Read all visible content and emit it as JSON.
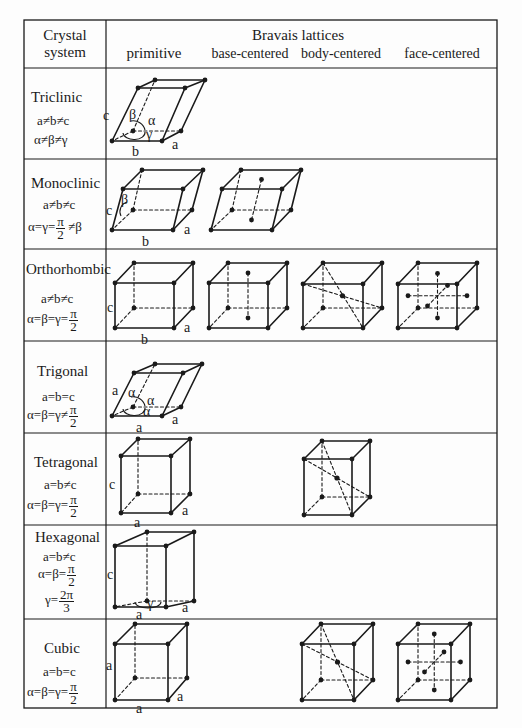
{
  "header": {
    "col1_line1": "Crystal",
    "col1_line2": "system",
    "col2_title": "Bravais lattices",
    "lattice_types": [
      "primitive",
      "base-centered",
      "body-centered",
      "face-centered"
    ]
  },
  "table": {
    "left": 24,
    "right": 497,
    "top": 20,
    "bottom": 708,
    "col_split": 106,
    "header_bottom": 68,
    "row_lines": [
      159,
      249,
      341,
      433,
      525,
      619
    ]
  },
  "systems": [
    {
      "name": "Triclinic",
      "cond1": "a≠b≠c",
      "cond2": "α≠β≠γ"
    },
    {
      "name": "Monoclinic",
      "cond1": "a≠b≠c",
      "cond2_pre": "α=γ=",
      "frac_num": "π",
      "frac_den": "2",
      "cond2_post": " ≠β"
    },
    {
      "name": "Orthorhombic",
      "cond1": "a≠b≠c",
      "cond2_pre": "α=β=γ=",
      "frac_num": "π",
      "frac_den": "2"
    },
    {
      "name": "Trigonal",
      "cond1": "a=b=c",
      "cond2_pre": "α=β=γ≠",
      "frac_num": "π",
      "frac_den": "2"
    },
    {
      "name": "Tetragonal",
      "cond1": "a=b≠c",
      "cond2_pre": "α=β=γ=",
      "frac_num": "π",
      "frac_den": "2"
    },
    {
      "name": "Hexagonal",
      "cond1": "a=b≠c",
      "cond2_pre": "α=β=",
      "frac_num": "π",
      "frac_den": "2",
      "cond3_pre": "γ=",
      "frac2_num": "2π",
      "frac2_den": "3"
    },
    {
      "name": "Cubic",
      "cond1": "a=b=c",
      "cond2_pre": "α=β=γ=",
      "frac_num": "π",
      "frac_den": "2"
    }
  ],
  "cells": [
    {
      "id": "triclinic-primitive",
      "type": "primitive",
      "v": {
        "FBL": [
          112,
          141
        ],
        "FBR": [
          162,
          141
        ],
        "BBL": [
          133,
          131
        ],
        "BBR": [
          181,
          131
        ],
        "FTL": [
          138,
          88
        ],
        "FTR": [
          185,
          88
        ],
        "BTL": [
          155,
          80
        ],
        "BTR": [
          205,
          80
        ]
      },
      "labels": [
        {
          "t": "c",
          "x": 103,
          "y": 120
        },
        {
          "t": "b",
          "x": 132,
          "y": 156
        },
        {
          "t": "a",
          "x": 172,
          "y": 149
        },
        {
          "t": "β",
          "x": 129,
          "y": 119
        },
        {
          "t": "α",
          "x": 148,
          "y": 125
        },
        {
          "t": "γ",
          "x": 146,
          "y": 139
        }
      ],
      "angle_arc": true
    },
    {
      "id": "monoclinic-primitive",
      "type": "primitive",
      "v": {
        "FBL": [
          112,
          230
        ],
        "FBR": [
          173,
          230
        ],
        "BBL": [
          133,
          210
        ],
        "BBR": [
          192,
          210
        ],
        "FTL": [
          123,
          189
        ],
        "FTR": [
          183,
          189
        ],
        "BTL": [
          142,
          170
        ],
        "BTR": [
          203,
          170
        ]
      },
      "labels": [
        {
          "t": "c",
          "x": 106,
          "y": 215
        },
        {
          "t": "b",
          "x": 142,
          "y": 246
        },
        {
          "t": "a",
          "x": 184,
          "y": 234
        },
        {
          "t": "β",
          "x": 121,
          "y": 204
        }
      ],
      "angle_arc_beta": true
    },
    {
      "id": "monoclinic-base",
      "type": "base",
      "v": {
        "FBL": [
          211,
          230
        ],
        "FBR": [
          272,
          230
        ],
        "BBL": [
          232,
          210
        ],
        "BBR": [
          291,
          210
        ],
        "FTL": [
          222,
          189
        ],
        "FTR": [
          282,
          189
        ],
        "BTL": [
          241,
          170
        ],
        "BTR": [
          301,
          170
        ]
      },
      "labels": []
    },
    {
      "id": "orthorhombic-primitive",
      "type": "primitive",
      "v": {
        "FBL": [
          115,
          328
        ],
        "FBR": [
          174,
          328
        ],
        "BBL": [
          134,
          308
        ],
        "BBR": [
          193,
          308
        ],
        "FTL": [
          115,
          283
        ],
        "FTR": [
          174,
          283
        ],
        "BTL": [
          134,
          263
        ],
        "BTR": [
          193,
          263
        ]
      },
      "labels": [
        {
          "t": "c",
          "x": 107,
          "y": 312
        },
        {
          "t": "b",
          "x": 141,
          "y": 344
        },
        {
          "t": "a",
          "x": 184,
          "y": 332
        }
      ]
    },
    {
      "id": "orthorhombic-base",
      "type": "base",
      "v": {
        "FBL": [
          209,
          328
        ],
        "FBR": [
          268,
          328
        ],
        "BBL": [
          228,
          308
        ],
        "BBR": [
          287,
          308
        ],
        "FTL": [
          209,
          283
        ],
        "FTR": [
          268,
          283
        ],
        "BTL": [
          228,
          263
        ],
        "BTR": [
          287,
          263
        ]
      },
      "labels": []
    },
    {
      "id": "orthorhombic-body",
      "type": "body",
      "v": {
        "FBL": [
          303,
          328
        ],
        "FBR": [
          363,
          328
        ],
        "BBL": [
          323,
          308
        ],
        "BBR": [
          382,
          308
        ],
        "FTL": [
          303,
          284
        ],
        "FTR": [
          363,
          284
        ],
        "BTL": [
          323,
          263
        ],
        "BTR": [
          382,
          263
        ]
      },
      "labels": []
    },
    {
      "id": "orthorhombic-face",
      "type": "face",
      "v": {
        "FBL": [
          398,
          328
        ],
        "FBR": [
          457,
          328
        ],
        "BBL": [
          418,
          308
        ],
        "BBR": [
          477,
          308
        ],
        "FTL": [
          398,
          284
        ],
        "FTR": [
          457,
          284
        ],
        "BTL": [
          418,
          263
        ],
        "BTR": [
          477,
          263
        ]
      },
      "labels": []
    },
    {
      "id": "trigonal-primitive",
      "type": "primitive",
      "v": {
        "FBL": [
          112,
          416
        ],
        "FBR": [
          162,
          416
        ],
        "BBL": [
          133,
          407
        ],
        "BBR": [
          181,
          407
        ],
        "FTL": [
          134,
          373
        ],
        "FTR": [
          183,
          373
        ],
        "BTL": [
          155,
          364
        ],
        "BTR": [
          202,
          364
        ]
      },
      "labels": [
        {
          "t": "a",
          "x": 112,
          "y": 395
        },
        {
          "t": "a",
          "x": 136,
          "y": 432
        },
        {
          "t": "a",
          "x": 172,
          "y": 424
        },
        {
          "t": "α",
          "x": 128,
          "y": 397
        },
        {
          "t": "α",
          "x": 147,
          "y": 405
        },
        {
          "t": "α",
          "x": 143,
          "y": 416
        }
      ],
      "angle_arc": true
    },
    {
      "id": "tetragonal-primitive",
      "type": "primitive",
      "v": {
        "FBL": [
          121,
          513
        ],
        "FBR": [
          171,
          513
        ],
        "BBL": [
          138,
          494
        ],
        "BBR": [
          190,
          494
        ],
        "FTL": [
          121,
          456
        ],
        "FTR": [
          171,
          456
        ],
        "BTL": [
          138,
          439
        ],
        "BTR": [
          190,
          439
        ]
      },
      "labels": [
        {
          "t": "c",
          "x": 109,
          "y": 489
        },
        {
          "t": "a",
          "x": 134,
          "y": 527
        },
        {
          "t": "a",
          "x": 182,
          "y": 515
        }
      ]
    },
    {
      "id": "tetragonal-body",
      "type": "body",
      "v": {
        "FBL": [
          304,
          515
        ],
        "FBR": [
          352,
          515
        ],
        "BBL": [
          322,
          497
        ],
        "BBR": [
          370,
          497
        ],
        "FTL": [
          304,
          459
        ],
        "FTR": [
          352,
          459
        ],
        "BTL": [
          322,
          441
        ],
        "BTR": [
          370,
          441
        ]
      },
      "labels": []
    },
    {
      "id": "hexagonal-primitive",
      "type": "primitive",
      "v": {
        "FBL": [
          115,
          607
        ],
        "FBR": [
          166,
          607
        ],
        "BBL": [
          147,
          601
        ],
        "BBR": [
          194,
          601
        ],
        "FTL": [
          115,
          546
        ],
        "FTR": [
          166,
          546
        ],
        "BTL": [
          147,
          532
        ],
        "BTR": [
          194,
          532
        ]
      },
      "labels": [
        {
          "t": "c",
          "x": 107,
          "y": 579
        },
        {
          "t": "a",
          "x": 136,
          "y": 619
        },
        {
          "t": "a",
          "x": 182,
          "y": 612
        },
        {
          "t": "γ",
          "x": 147,
          "y": 608
        }
      ],
      "gamma_arc": true
    },
    {
      "id": "cubic-primitive",
      "type": "primitive",
      "v": {
        "FBL": [
          115,
          700
        ],
        "FBR": [
          168,
          700
        ],
        "BBL": [
          135,
          678
        ],
        "BBR": [
          187,
          678
        ],
        "FTL": [
          115,
          644
        ],
        "FTR": [
          168,
          644
        ],
        "BTL": [
          135,
          624
        ],
        "BTR": [
          187,
          624
        ]
      },
      "labels": [
        {
          "t": "a",
          "x": 106,
          "y": 670
        },
        {
          "t": "a",
          "x": 136,
          "y": 713
        },
        {
          "t": "a",
          "x": 177,
          "y": 701
        }
      ]
    },
    {
      "id": "cubic-body",
      "type": "body",
      "v": {
        "FBL": [
          302,
          700
        ],
        "FBR": [
          354,
          700
        ],
        "BBL": [
          321,
          680
        ],
        "BBR": [
          373,
          680
        ],
        "FTL": [
          302,
          644
        ],
        "FTR": [
          354,
          644
        ],
        "BTL": [
          321,
          624
        ],
        "BTR": [
          373,
          624
        ]
      },
      "labels": []
    },
    {
      "id": "cubic-face",
      "type": "face",
      "v": {
        "FBL": [
          398,
          700
        ],
        "FBR": [
          451,
          700
        ],
        "BBL": [
          418,
          680
        ],
        "BBR": [
          470,
          680
        ],
        "FTL": [
          398,
          644
        ],
        "FTR": [
          451,
          644
        ],
        "BTL": [
          418,
          624
        ],
        "BTR": [
          470,
          624
        ]
      },
      "labels": []
    }
  ],
  "colors": {
    "ink": "#1a1a1a",
    "paper": "#fdfdfd"
  }
}
